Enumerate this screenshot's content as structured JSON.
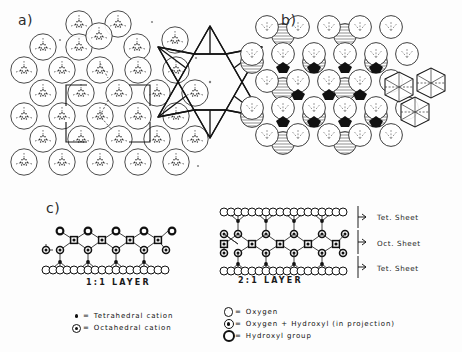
{
  "figure": {
    "background": "#fdfdfd",
    "ink": "#111111",
    "shade": "#b4b4b4"
  },
  "panels": {
    "a": {
      "label": "a)",
      "content": "tetrahedral sheet in plan view with hexagonal ring of tetrahedra and unit cell outline"
    },
    "b": {
      "label": "b)",
      "content": "octahedral sheet in plan view with cluster of three octahedra"
    },
    "c": {
      "label": "c)",
      "content": "side elevations of 1:1 and 2:1 layer structures"
    }
  },
  "layers": {
    "one_to_one": {
      "caption": "1:1  LAYER",
      "hydroxyl_top_count": 6,
      "octahedral_count": 6,
      "oxhydroxyl_row_count": 6,
      "oxygen_basal_count": 13,
      "tetrahedral_count": 5
    },
    "two_to_one": {
      "caption": "2:1  LAYER",
      "oxygen_top_count": 13,
      "tetrahedral_top_count": 5,
      "oxhydroxyl_upper_count": 6,
      "octahedral_count": 6,
      "oxhydroxyl_lower_count": 6,
      "tetrahedral_bottom_count": 5,
      "oxygen_bottom_count": 13
    }
  },
  "sheet_labels": [
    {
      "text": "Tet.  Sheet"
    },
    {
      "text": "Oct.  Sheet"
    },
    {
      "text": "Tet.  Sheet"
    }
  ],
  "legend_left": {
    "items": [
      {
        "symbol": "tetrahedral-cation-dot",
        "equals": "=",
        "label": "Tetrahedral  cation"
      },
      {
        "symbol": "octahedral-cation-circle",
        "equals": "=",
        "label": "Octahedral   cation"
      }
    ]
  },
  "legend_right": {
    "items": [
      {
        "symbol": "oxygen-open-circle",
        "equals": "=",
        "label": "Oxygen"
      },
      {
        "symbol": "oxygen-hydroxyl-circle",
        "equals": "=",
        "label": "Oxygen + Hydroxyl  (in projection)"
      },
      {
        "symbol": "hydroxyl-thick-circle",
        "equals": "=",
        "label": "Hydroxyl  group"
      }
    ]
  }
}
